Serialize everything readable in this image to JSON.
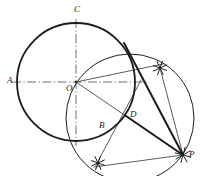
{
  "figure": {
    "width": 204,
    "height": 176,
    "background_color": "#ffffff",
    "ink_color": "#1c1c1c",
    "thin_color": "#4a4a4a",
    "labels": [
      {
        "id": "A",
        "text": "A",
        "x": 7,
        "y": 76
      },
      {
        "id": "B",
        "text": "B",
        "x": 99,
        "y": 121
      },
      {
        "id": "C",
        "text": "C",
        "x": 74,
        "y": 5
      },
      {
        "id": "D",
        "text": "D",
        "x": 130,
        "y": 110
      },
      {
        "id": "O",
        "text": "O",
        "x": 66,
        "y": 84
      },
      {
        "id": "P",
        "text": "P",
        "x": 189,
        "y": 150
      }
    ],
    "points": {
      "O": {
        "x": 76,
        "y": 82
      },
      "A": {
        "x": 17,
        "y": 82
      },
      "C": {
        "x": 76,
        "y": 23
      },
      "B": {
        "x": 110,
        "y": 129
      },
      "D": {
        "x": 126,
        "y": 116
      },
      "P": {
        "x": 183,
        "y": 155
      },
      "T_upper": {
        "x": 128,
        "y": 55
      },
      "arc_mark_upper": {
        "x": 160,
        "y": 68
      },
      "arc_mark_lower": {
        "x": 98,
        "y": 163
      },
      "arc_mark_at_P": {
        "x": 183,
        "y": 155
      }
    },
    "main_circle": {
      "name": "given-circle",
      "cx": 76,
      "cy": 82,
      "r": 59,
      "stroke_width": 1.8
    },
    "second_circle": {
      "name": "circle-on-OP-as-diameter",
      "cx": 130,
      "cy": 118,
      "r": 64,
      "stroke_width": 1.0
    },
    "axes": {
      "horizontal": {
        "x1": 12,
        "y1": 82,
        "x2": 148,
        "y2": 82,
        "style": "dash-dot"
      },
      "vertical": {
        "x1": 76,
        "y1": 19,
        "x2": 76,
        "y2": 146,
        "style": "dash-dot"
      }
    },
    "thick_lines": [
      {
        "name": "tangent-P-to-upper-contact",
        "x1": 183,
        "y1": 155,
        "x2": 124,
        "y2": 43
      },
      {
        "name": "chord-P-to-D",
        "x1": 183,
        "y1": 155,
        "x2": 126,
        "y2": 116
      }
    ],
    "thin_lines": [
      {
        "name": "radius-O-to-P",
        "x1": 76,
        "y1": 82,
        "x2": 183,
        "y2": 155
      },
      {
        "name": "radius-O-to-upper-mark",
        "x1": 76,
        "y1": 82,
        "x2": 163,
        "y2": 64
      },
      {
        "name": "line-upper-mark-to-P",
        "x1": 160,
        "y1": 68,
        "x2": 183,
        "y2": 155
      },
      {
        "name": "line-P-to-lower-mark",
        "x1": 183,
        "y1": 155,
        "x2": 94,
        "y2": 167
      },
      {
        "name": "line-D-to-lower-mark",
        "x1": 141,
        "y1": 80,
        "x2": 96,
        "y2": 165
      }
    ],
    "cross_marks": [
      {
        "name": "arc-intersection-upper",
        "x": 160,
        "y": 68,
        "size": 7,
        "rot": 20
      },
      {
        "name": "arc-intersection-lower",
        "x": 98,
        "y": 163,
        "size": 7,
        "rot": 20
      },
      {
        "name": "arc-intersection-at-P",
        "x": 183,
        "y": 155,
        "size": 8,
        "rot": 15
      }
    ]
  }
}
